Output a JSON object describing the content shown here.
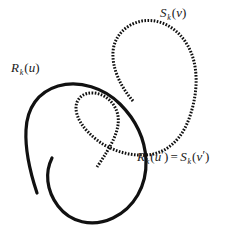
{
  "figure": {
    "name": "curve-intersection-diagram",
    "width": 240,
    "height": 234,
    "background_color": "#ffffff",
    "stroke_color": "#111111"
  },
  "labels": {
    "s_curve": {
      "full_text": "S k (v )",
      "base": "S",
      "subscript": "k",
      "open_paren": "(",
      "argument": "v",
      "close_paren": ")"
    },
    "r_curve": {
      "full_text": "R k (u )",
      "base": "R",
      "subscript": "k",
      "open_paren": "(",
      "argument": "u",
      "close_paren": ")"
    },
    "intersection": {
      "full_text": "R k (u ' ) = S k (v ' )",
      "left_base": "R",
      "left_subscript": "k",
      "left_open_paren": "(",
      "left_argument": "u",
      "left_prime": "′",
      "left_close_paren": ")",
      "equals": "=",
      "right_base": "S",
      "right_subscript": "k",
      "right_open_paren": "(",
      "right_argument": "v",
      "right_prime": "′",
      "right_close_paren": ")"
    }
  },
  "curves": {
    "r_curve": {
      "style": "solid",
      "stroke_width": 3.2,
      "path": "M 37 193 C 30 172, 25 150, 26 130 C 27 108, 38 92, 58 86 C 80 80, 104 88, 120 104 C 136 120, 145 140, 146 160 C 147 186, 134 208, 113 218 C 92 228, 70 222, 58 206 C 46 190, 45 172, 52 158"
    },
    "s_curve": {
      "style": "beaded-dashed",
      "stroke_width": 3.0,
      "dash_pattern": "1.6 1.5",
      "path": "M 133 101 C 120 86, 112 68, 113 52 C 114 36, 126 24, 142 21 C 160 18, 178 28, 188 46 C 199 66, 198 92, 190 116 C 182 140, 166 154, 146 155 C 128 156, 110 150, 97 140 C 84 130, 76 118, 76 108 C 76 98, 84 92, 94 93 C 106 94, 116 104, 118 116 C 120 130, 112 145, 97 167"
    }
  }
}
